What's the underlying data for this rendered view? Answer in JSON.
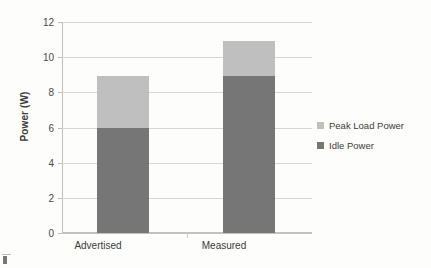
{
  "chart_data": {
    "type": "bar",
    "subtype": "stacked-vertical-bar",
    "title": "",
    "xlabel": "",
    "ylabel": "Power (W)",
    "categories": [
      "Advertised",
      "Measured"
    ],
    "series": [
      {
        "name": "Idle Power",
        "values": [
          6,
          9
        ],
        "color": "#767676"
      },
      {
        "name": "Peak Load Power",
        "values": [
          3,
          2
        ],
        "color": "#bfbfbf"
      }
    ],
    "stack_totals": [
      9,
      11
    ],
    "ylim": [
      0,
      12
    ],
    "ytick_values": [
      0,
      2,
      4,
      6,
      8,
      10,
      12
    ],
    "ytick_labels": [
      "0",
      "2",
      "4",
      "6",
      "8",
      "10",
      "12"
    ],
    "grid": {
      "horizontal": true,
      "vertical": false,
      "color": "#d6d6d6"
    },
    "legend": {
      "position": "right",
      "entries": [
        {
          "label": "Peak Load Power",
          "color": "#bfbfbf"
        },
        {
          "label": "Idle Power",
          "color": "#767676"
        }
      ]
    }
  },
  "axes": {
    "y_title": "Power (W)",
    "y_ticks": [
      "12",
      "10",
      "8",
      "6",
      "4",
      "2",
      "0"
    ],
    "x_ticks": [
      "Advertised",
      "Measured"
    ]
  },
  "legend": {
    "items": [
      {
        "label": "Peak Load Power",
        "color": "#bfbfbf"
      },
      {
        "label": "Idle Power",
        "color": "#767676"
      }
    ]
  },
  "colors": {
    "idle_power": "#767676",
    "peak_load_power": "#bfbfbf",
    "gridline": "#d6d6d6",
    "axis": "#bfbfbf",
    "text": "#3b3b3b",
    "background": "#fdfdfc"
  }
}
